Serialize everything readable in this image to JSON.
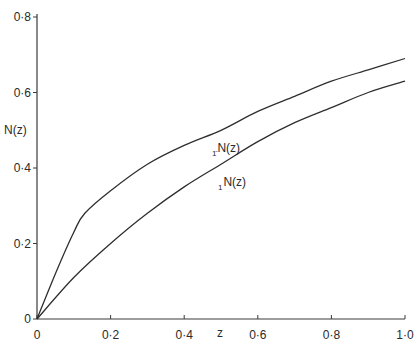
{
  "chart_data": {
    "type": "line",
    "title": "",
    "xlabel": "z",
    "ylabel": "N(z)",
    "xlim": [
      0,
      1.0
    ],
    "ylim": [
      0,
      0.8
    ],
    "grid": false,
    "legend": "inline labels on curves",
    "x_ticks": [
      "0",
      "0·2",
      "0·4",
      "0·6",
      "0·8",
      "1·0"
    ],
    "y_ticks": [
      "0",
      "0·2",
      "0·4",
      "0·6",
      "0·8"
    ],
    "series": [
      {
        "name": "1̄N(z)",
        "label_prefix": "1̄",
        "label_main": "N(z)",
        "x": [
          0,
          0.05,
          0.1,
          0.13,
          0.2,
          0.3,
          0.4,
          0.5,
          0.6,
          0.7,
          0.8,
          0.9,
          1.0
        ],
        "values": [
          0,
          0.12,
          0.23,
          0.28,
          0.34,
          0.41,
          0.46,
          0.5,
          0.55,
          0.59,
          0.63,
          0.66,
          0.69
        ]
      },
      {
        "name": "1N(z)",
        "label_prefix": "1",
        "label_main": "N(z)",
        "x": [
          0,
          0.1,
          0.2,
          0.3,
          0.4,
          0.5,
          0.6,
          0.7,
          0.8,
          0.9,
          1.0
        ],
        "values": [
          0,
          0.11,
          0.2,
          0.28,
          0.35,
          0.41,
          0.47,
          0.52,
          0.56,
          0.6,
          0.63
        ]
      }
    ]
  }
}
